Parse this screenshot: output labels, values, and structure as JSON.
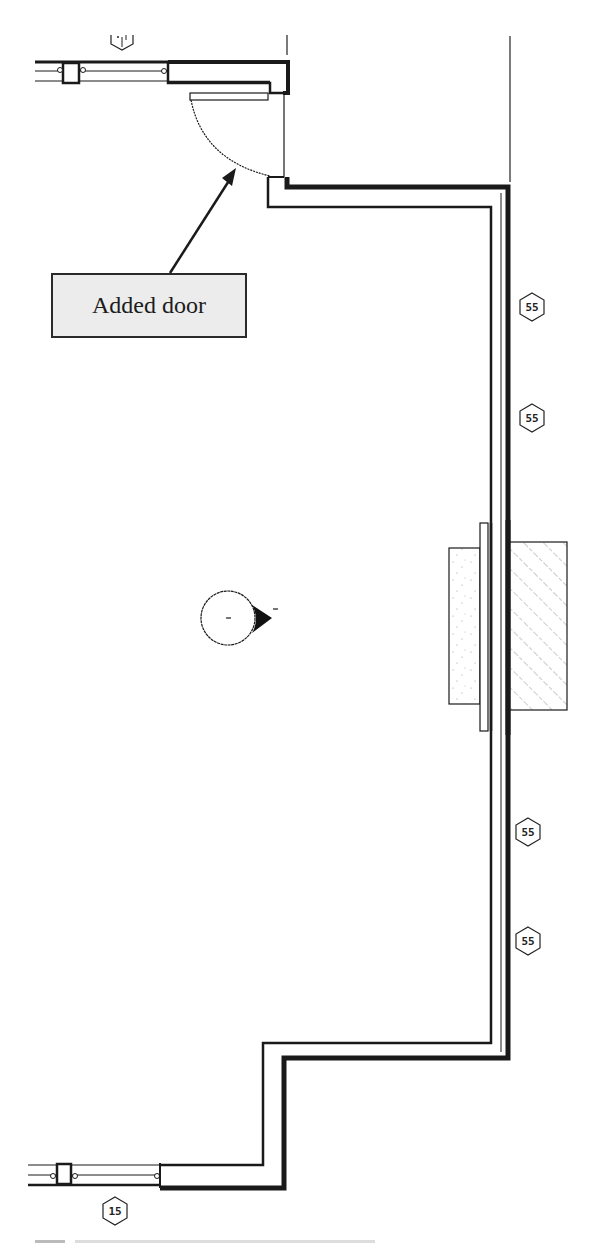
{
  "diagram": {
    "type": "architectural-floor-plan",
    "callout": {
      "label": "Added door",
      "arrow_target": "door-swing-arc"
    },
    "colors": {
      "line": "#1a1a1a",
      "callout_fill": "#ececec",
      "background": "#ffffff"
    },
    "tags": [
      {
        "id": "wall-tag-1",
        "label": "55",
        "x": 532,
        "y": 307
      },
      {
        "id": "wall-tag-2",
        "label": "55",
        "x": 532,
        "y": 418
      },
      {
        "id": "wall-tag-3",
        "label": "55",
        "x": 528,
        "y": 832
      },
      {
        "id": "wall-tag-4",
        "label": "55",
        "x": 528,
        "y": 941
      },
      {
        "id": "window-tag-bottom",
        "label": "15",
        "x": 115,
        "y": 1211
      }
    ],
    "elements": [
      "exterior-wall",
      "window-top",
      "window-bottom",
      "added-door",
      "fireplace-hearth",
      "fireplace-chimney",
      "elevation-marker"
    ],
    "caption": ""
  }
}
